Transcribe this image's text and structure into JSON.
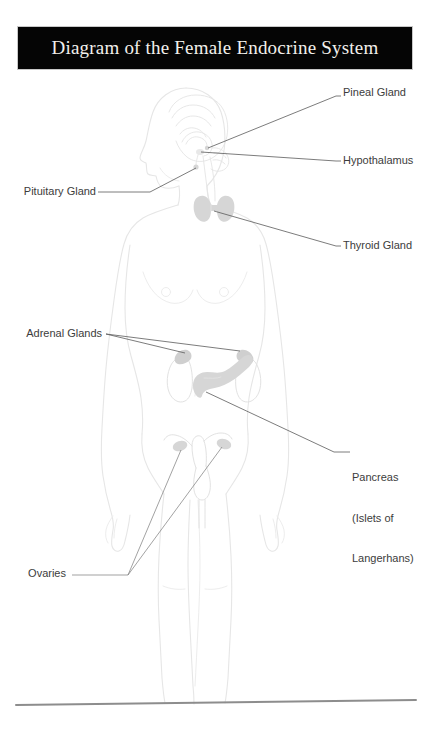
{
  "page": {
    "background_color": "#ffffff",
    "width": 432,
    "height": 737
  },
  "banner": {
    "title": "Diagram of the Female Endocrine System",
    "background_color": "#050505",
    "text_color": "#f2f0ec"
  },
  "diagram": {
    "outline_color": "#e8e8e8",
    "organ_fill_color": "#d4d4d4",
    "leader_line_color": "#555555",
    "ground_line_color": "#8a8a8a",
    "organs": [
      {
        "name": "brain",
        "region": "head"
      },
      {
        "name": "pineal-gland",
        "region": "brain-center"
      },
      {
        "name": "hypothalamus",
        "region": "brain-center"
      },
      {
        "name": "pituitary-gland",
        "region": "brain-base"
      },
      {
        "name": "thyroid-gland",
        "region": "neck"
      },
      {
        "name": "adrenal-glands",
        "region": "upper-kidneys"
      },
      {
        "name": "kidneys",
        "region": "abdomen"
      },
      {
        "name": "pancreas",
        "region": "abdomen"
      },
      {
        "name": "uterus",
        "region": "pelvis"
      },
      {
        "name": "ovaries",
        "region": "pelvis"
      }
    ]
  },
  "labels": {
    "pineal": {
      "text": "Pineal Gland",
      "side": "right",
      "x": 343,
      "y": 92
    },
    "hypothalamus": {
      "text": "Hypothalamus",
      "side": "right",
      "x": 343,
      "y": 157
    },
    "pituitary": {
      "text": "Pituitary Gland",
      "side": "left",
      "x": 14,
      "y": 188
    },
    "thyroid": {
      "text": "Thyroid Gland",
      "side": "right",
      "x": 343,
      "y": 241
    },
    "adrenal": {
      "text": "Adrenal Glands",
      "side": "left",
      "x": 18,
      "y": 330
    },
    "pancreas": {
      "line1": "Pancreas",
      "line2": "(Islets of",
      "line3": "Langerhans)",
      "side": "right",
      "x": 355,
      "y": 447
    },
    "ovaries": {
      "text": "Ovaries",
      "side": "left",
      "x": 22,
      "y": 570
    }
  }
}
